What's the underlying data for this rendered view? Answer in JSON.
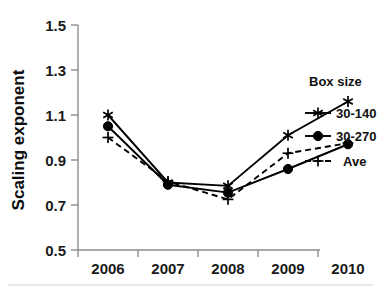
{
  "chart_data": {
    "type": "line",
    "title": "",
    "xlabel": "",
    "ylabel": "Scaling exponent",
    "categories": [
      "2006",
      "2007",
      "2008",
      "2009",
      "2010"
    ],
    "x": [
      2006,
      2007,
      2008,
      2009,
      2010
    ],
    "ylim": [
      0.5,
      1.5
    ],
    "yticks": [
      "0.5",
      "0.7",
      "0.9",
      "1.1",
      "1.3",
      "1.5"
    ],
    "ytick_values": [
      0.5,
      0.7,
      0.9,
      1.1,
      1.3,
      1.5
    ],
    "grid": false,
    "legend_position": "right",
    "legend_title": "Box size",
    "series": [
      {
        "name": "30-140",
        "marker": "asterisk",
        "linestyle": "solid",
        "color": "#000000",
        "values": [
          1.1,
          0.8,
          0.785,
          1.01,
          1.16
        ]
      },
      {
        "name": "30-270",
        "marker": "circle",
        "linestyle": "solid",
        "color": "#000000",
        "values": [
          1.05,
          0.79,
          0.755,
          0.86,
          0.97
        ]
      },
      {
        "name": "Ave",
        "marker": "plus",
        "linestyle": "dashed",
        "color": "#000000",
        "values": [
          1.0,
          0.805,
          0.725,
          0.93,
          0.975
        ]
      }
    ]
  },
  "axes": {
    "y_title": "Scaling exponent",
    "x_title": ""
  },
  "legend": {
    "title": "Box size",
    "entries": [
      {
        "label": "30-140",
        "marker": "asterisk-icon",
        "style": "solid"
      },
      {
        "label": "30-270",
        "marker": "filled-circle-icon",
        "style": "solid"
      },
      {
        "label": "Ave",
        "marker": "plus-icon",
        "style": "dashed"
      }
    ]
  },
  "colors": {
    "axis": "#8d8d8d",
    "text": "#111111",
    "series": "#000000",
    "background": "#ffffff"
  }
}
